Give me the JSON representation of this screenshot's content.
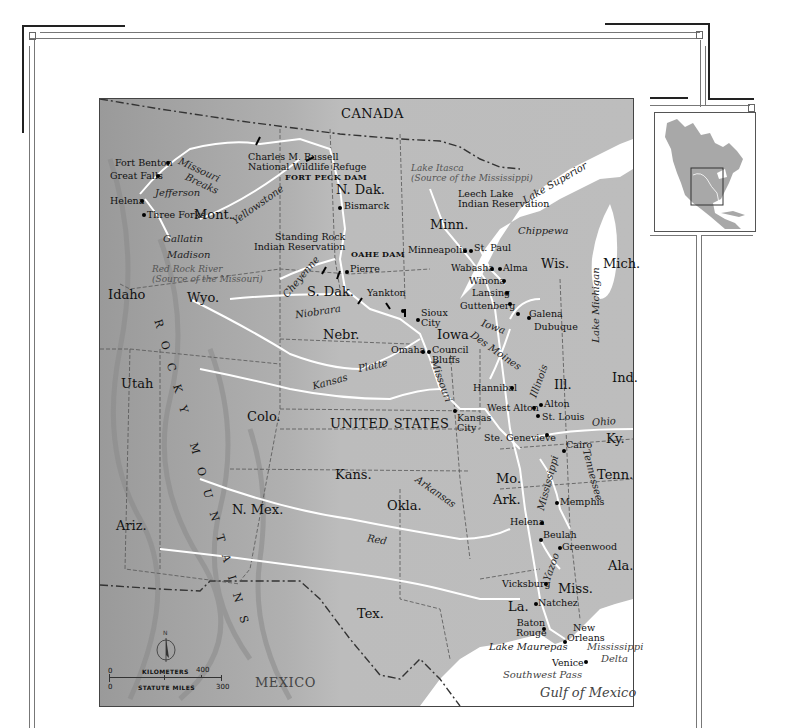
{
  "map": {
    "title_region": "Missouri–Mississippi River Basin",
    "countries": [
      {
        "name": "CANADA",
        "x": 245,
        "y": 8
      },
      {
        "name": "UNITED STATES",
        "x": 230,
        "y": 318
      },
      {
        "name": "MEXICO",
        "x": 155,
        "y": 577
      }
    ],
    "states": [
      {
        "name": "Mont.",
        "x": 95,
        "y": 104
      },
      {
        "name": "N. Dak.",
        "x": 213,
        "y": 50
      },
      {
        "name": "Minn.",
        "x": 306,
        "y": 143
      },
      {
        "name": "Wis.",
        "x": 397,
        "y": 190
      },
      {
        "name": "Mich.",
        "x": 467,
        "y": 190
      },
      {
        "name": "S. Dak.",
        "x": 182,
        "y": 210
      },
      {
        "name": "Wyo.",
        "x": 90,
        "y": 211
      },
      {
        "name": "Idaho",
        "x": 8,
        "y": 211
      },
      {
        "name": "Nebr.",
        "x": 192,
        "y": 272
      },
      {
        "name": "Iowa",
        "x": 337,
        "y": 275
      },
      {
        "name": "Utah",
        "x": 10,
        "y": 347
      },
      {
        "name": "Colo.",
        "x": 137,
        "y": 373
      },
      {
        "name": "Ill.",
        "x": 397,
        "y": 325
      },
      {
        "name": "Ind.",
        "x": 463,
        "y": 341
      },
      {
        "name": "Kans.",
        "x": 236,
        "y": 383
      },
      {
        "name": "Mo.",
        "x": 339,
        "y": 420
      },
      {
        "name": "Ky.",
        "x": 477,
        "y": 378
      },
      {
        "name": "Tenn.",
        "x": 469,
        "y": 417
      },
      {
        "name": "Ark.",
        "x": 253,
        "y": 442
      },
      {
        "name": "Okla.",
        "x": 262,
        "y": 400
      },
      {
        "name": "N. Mex.",
        "x": 112,
        "y": 406
      },
      {
        "name": "Ariz.",
        "x": 18,
        "y": 446
      },
      {
        "name": "Ala.",
        "x": 473,
        "y": 482
      },
      {
        "name": "Miss.",
        "x": 421,
        "y": 517
      },
      {
        "name": "La.",
        "x": 370,
        "y": 520
      },
      {
        "name": "Tex.",
        "x": 243,
        "y": 507
      }
    ],
    "cities": [
      {
        "name": "Fort Benton",
        "x": 14,
        "y": 32,
        "dot_x": 67,
        "dot_y": 34
      },
      {
        "name": "Great Falls",
        "x": 8,
        "y": 47,
        "dot_x": 55,
        "dot_y": 49
      },
      {
        "name": "Helena",
        "x": 8,
        "y": 73,
        "dot_x": 38,
        "dot_y": 76
      },
      {
        "name": "Three Forks",
        "x": 45,
        "y": 86,
        "dot_x": 41,
        "dot_y": 89
      },
      {
        "name": "Bismarck",
        "x": 243,
        "y": 38,
        "dot_x": 239,
        "dot_y": 41
      },
      {
        "name": "Pierre",
        "x": 216,
        "y": 164,
        "dot_x": 212,
        "dot_y": 167
      },
      {
        "name": "Yankton",
        "x": 219,
        "y": 187
      },
      {
        "name": "Sioux City",
        "x": 319,
        "y": 206,
        "multiline": "Sioux\nCity",
        "dot_x": 316,
        "dot_y": 220
      },
      {
        "name": "Omaha",
        "x": 310,
        "y": 245,
        "dot_x": 325,
        "dot_y": 249
      },
      {
        "name": "Council Bluffs",
        "x": 334,
        "y": 245,
        "multiline": "Council\nBluffs",
        "dot_x": 331,
        "dot_y": 249
      },
      {
        "name": "Minneapolis",
        "x": 310,
        "y": 212,
        "dot_x": 364,
        "dot_y": 117
      },
      {
        "name": "St. Paul",
        "x": 374,
        "y": 110,
        "dot_x": 370,
        "dot_y": 117
      },
      {
        "name": "Wabasha",
        "x": 334,
        "y": 135,
        "dot_x": 391,
        "dot_y": 138
      },
      {
        "name": "Alma",
        "x": 400,
        "y": 135,
        "dot_x": 397,
        "dot_y": 138
      },
      {
        "name": "Winona",
        "x": 369,
        "y": 147,
        "dot_x": 401,
        "dot_y": 150
      },
      {
        "name": "Lansing",
        "x": 371,
        "y": 159,
        "dot_x": 405,
        "dot_y": 162
      },
      {
        "name": "Guttenberg",
        "x": 361,
        "y": 171,
        "dot_x": 408,
        "dot_y": 174
      },
      {
        "name": "Galena",
        "x": 429,
        "y": 180,
        "dot_x": 418,
        "dot_y": 179
      },
      {
        "name": "Dubuque",
        "x": 434,
        "y": 193,
        "dot_x": 428,
        "dot_y": 184
      },
      {
        "name": "Hannibal",
        "x": 373,
        "y": 284,
        "dot_x": 409,
        "dot_y": 287
      },
      {
        "name": "West Alton",
        "x": 356,
        "y": 304,
        "dot_x": 413,
        "dot_y": 307
      },
      {
        "name": "Alton",
        "x": 425,
        "y": 301,
        "dot_x": 421,
        "dot_y": 304
      },
      {
        "name": "St. Louis",
        "x": 424,
        "y": 317,
        "dot_x": 420,
        "dot_y": 316
      },
      {
        "name": "Kansas City",
        "x": 355,
        "y": 314,
        "multiline": "Kansas\nCity",
        "dot_x": 354,
        "dot_y": 311
      },
      {
        "name": "Ste. Genevieve",
        "x": 368,
        "y": 336,
        "dot_x": 424,
        "dot_y": 334
      },
      {
        "name": "Cairo",
        "x": 446,
        "y": 347,
        "dot_x": 443,
        "dot_y": 357
      },
      {
        "name": "Memphis",
        "x": 445,
        "y": 398,
        "dot_x": 441,
        "dot_y": 401
      },
      {
        "name": "Helena",
        "x": 413,
        "y": 415,
        "dot_x": 440,
        "dot_y": 422
      },
      {
        "name": "Beulah",
        "x": 445,
        "y": 432,
        "dot_x": 440,
        "dot_y": 439
      },
      {
        "name": "Greenwood",
        "x": 461,
        "y": 447,
        "dot_x": 457,
        "dot_y": 450
      },
      {
        "name": "Vicksburg",
        "x": 402,
        "y": 485,
        "dot_x": 445,
        "dot_y": 487
      },
      {
        "name": "Natchez",
        "x": 438,
        "y": 500,
        "dot_x": 435,
        "dot_y": 503
      },
      {
        "name": "Baton Rouge",
        "x": 420,
        "y": 518,
        "multiline": "Baton\nRouge",
        "dot_x": 443,
        "dot_y": 527
      },
      {
        "name": "New Orleans",
        "x": 470,
        "y": 524,
        "multiline": "New\nOrleans",
        "dot_x": 466,
        "dot_y": 541
      },
      {
        "name": "Venice",
        "x": 481,
        "y": 558,
        "dot_x": 485,
        "dot_y": 560
      }
    ],
    "rivers": [
      {
        "name": "Missouri",
        "x": 78,
        "y": 36,
        "rotate": 25
      },
      {
        "name": "Breaks",
        "x": 82,
        "y": 50,
        "rotate": 25
      },
      {
        "name": "Jefferson",
        "x": 57,
        "y": 65,
        "rotate": 0
      },
      {
        "name": "Yellowstone",
        "x": 133,
        "y": 81,
        "rotate": -35
      },
      {
        "name": "Gallatin",
        "x": 63,
        "y": 115,
        "rotate": 0
      },
      {
        "name": "Madison",
        "x": 66,
        "y": 133,
        "rotate": 0
      },
      {
        "name": "Cheyenne",
        "x": 180,
        "y": 165,
        "rotate": -50
      },
      {
        "name": "Niobrara",
        "x": 157,
        "y": 204,
        "rotate": -8
      },
      {
        "name": "Platte",
        "x": 262,
        "y": 258,
        "rotate": -12
      },
      {
        "name": "Kansas",
        "x": 188,
        "y": 288,
        "rotate": -15
      },
      {
        "name": "Missouri",
        "x": 322,
        "y": 280,
        "rotate": 70
      },
      {
        "name": "Iowa",
        "x": 426,
        "y": 192,
        "rotate": 20
      },
      {
        "name": "Des Moines",
        "x": 423,
        "y": 216,
        "rotate": 35
      },
      {
        "name": "Illinois",
        "x": 394,
        "y": 296,
        "rotate": -70
      },
      {
        "name": "Ohio",
        "x": 441,
        "y": 349,
        "rotate": -5
      },
      {
        "name": "Tennessee",
        "x": 441,
        "y": 368,
        "rotate": 75
      },
      {
        "name": "Mississippi",
        "x": 405,
        "y": 385,
        "rotate": -75
      },
      {
        "name": "Arkansas",
        "x": 315,
        "y": 428,
        "rotate": 35
      },
      {
        "name": "Red",
        "x": 269,
        "y": 465,
        "rotate": 10
      },
      {
        "name": "Yazoo",
        "x": 432,
        "y": 460,
        "rotate": -70
      },
      {
        "name": "Chippewa",
        "x": 443,
        "y": 130,
        "rotate": 0
      }
    ],
    "waters": [
      {
        "name": "Lake Superior",
        "lines": [
          "Lake",
          "Superior"
        ]
      },
      {
        "name": "Lake Michigan",
        "lines": [
          "Lake",
          "Michigan"
        ]
      },
      {
        "name": "Lake Maurepas"
      },
      {
        "name": "Mississippi Delta",
        "lines": [
          "Mississippi",
          "Delta"
        ]
      },
      {
        "name": "Southwest Pass"
      },
      {
        "name": "Gulf of Mexico"
      }
    ],
    "landmarks": {
      "charles_russell": [
        "Charles M. Russell",
        "National Wildlife Refuge"
      ],
      "fort_peck_dam": "FORT PECK DAM",
      "oahe_dam": "OAHE DAM",
      "standing_rock": [
        "Standing Rock",
        "Indian Reservation"
      ],
      "leech_lake": [
        "Leech Lake",
        "Indian Reservation"
      ],
      "lake_itasca": [
        "Lake Itasca",
        "(Source of the Mississippi)"
      ],
      "red_rock_river": [
        "Red Rock River",
        "(Source of the Missouri)"
      ],
      "rocky_mountains": "ROCKY MOUNTAINS"
    },
    "scale": {
      "kilometers_label": "KILOMETERS",
      "miles_label": "STATUTE MILES",
      "km_start": "0",
      "km_end": "400",
      "mi_start": "0",
      "mi_end": "300",
      "north_label": "N"
    }
  },
  "inset": {
    "label": "North America locator",
    "highlight": "Missouri–Mississippi basin"
  },
  "colors": {
    "land": "#b9b9b9",
    "relief_dark": "#8f8f8f",
    "water": "#ffffff",
    "border": "#444444",
    "frame": "#222222"
  }
}
